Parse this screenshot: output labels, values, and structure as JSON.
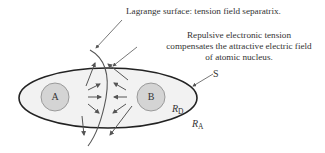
{
  "diagram": {
    "annotations": {
      "lagrange_surface": "Lagrange surface: tension field separatrix.",
      "repulsive_line1": "Repulsive electronic tension",
      "repulsive_line2": "compensates the attractive electric field",
      "repulsive_line3": "of atomic nucleus."
    },
    "labels": {
      "surface": "S",
      "atom_a": "A",
      "atom_b": "B",
      "r_d_main": "R",
      "r_d_sub": "D",
      "r_a_main": "R",
      "r_a_sub": "A"
    },
    "colors": {
      "ellipse_fill": "#f2f2f2",
      "ellipse_stroke": "#222222",
      "nucleus_fill": "#d4d4d4",
      "nucleus_stroke": "#888888",
      "arrow": "#555555",
      "text": "#333333"
    }
  }
}
